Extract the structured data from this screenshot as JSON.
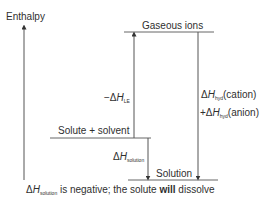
{
  "axis": {
    "label": "Enthalpy"
  },
  "levels": {
    "gaseous_ions": "Gaseous ions",
    "solute_solvent": "Solute + solvent",
    "solution": "Solution"
  },
  "arrows": {
    "lattice": {
      "prefix": "−Δ",
      "symbol": "H",
      "sub": "LE"
    },
    "solution": {
      "prefix": "Δ",
      "symbol": "H",
      "sub": "solution"
    },
    "hyd_cation": {
      "prefix": "Δ",
      "symbol": "H",
      "sub": "hyd",
      "suffix": "(cation)"
    },
    "hyd_anion": {
      "prefix": "+Δ",
      "symbol": "H",
      "sub": "hyd",
      "suffix": "(anion)"
    }
  },
  "caption": {
    "prefix": "Δ",
    "symbol": "H",
    "sub": "solution",
    "text_a": " is negative; the solute ",
    "bold": "will",
    "text_b": " dissolve"
  },
  "colors": {
    "line": "#555555",
    "text": "#2f2f2f"
  }
}
